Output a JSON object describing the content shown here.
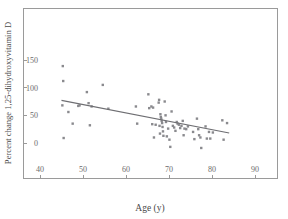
{
  "chart_data": {
    "type": "scatter",
    "title": "",
    "xlabel": "Age (y)",
    "ylabel": "Percent change 1,25-dihydroxyvitamin D",
    "xlim": [
      36,
      94
    ],
    "ylim": [
      -25,
      175
    ],
    "xticks": [
      40,
      50,
      60,
      70,
      80,
      90
    ],
    "yticks": [
      0,
      50,
      100,
      150
    ],
    "xtick_labels": [
      "40",
      "50",
      "60",
      "70",
      "80",
      "90"
    ],
    "ytick_labels": [
      "0",
      "50",
      "100",
      "150"
    ],
    "grid": false,
    "legend": null,
    "marker_color": "#8a8a8e",
    "line_color": "#6e6e72",
    "frame_color": "#9a9a9a",
    "points": [
      [
        45.3,
        139
      ],
      [
        45.4,
        112
      ],
      [
        45.2,
        68
      ],
      [
        45.5,
        9
      ],
      [
        46.6,
        56
      ],
      [
        47.6,
        35
      ],
      [
        48.9,
        67
      ],
      [
        49.2,
        68
      ],
      [
        50.9,
        92
      ],
      [
        51.3,
        72
      ],
      [
        51.6,
        32
      ],
      [
        52.0,
        66
      ],
      [
        54.6,
        105
      ],
      [
        55.9,
        62
      ],
      [
        62.3,
        66
      ],
      [
        62.6,
        35
      ],
      [
        65.2,
        88
      ],
      [
        65.4,
        63
      ],
      [
        65.9,
        66
      ],
      [
        66.1,
        34
      ],
      [
        66.3,
        64
      ],
      [
        66.5,
        10
      ],
      [
        66.9,
        33
      ],
      [
        67.6,
        73
      ],
      [
        67.7,
        78
      ],
      [
        67.8,
        31
      ],
      [
        67.9,
        17
      ],
      [
        68.0,
        52
      ],
      [
        68.1,
        47
      ],
      [
        68.2,
        44
      ],
      [
        68.3,
        40
      ],
      [
        68.4,
        36
      ],
      [
        68.5,
        29
      ],
      [
        68.6,
        21
      ],
      [
        68.7,
        13
      ],
      [
        69.0,
        75
      ],
      [
        69.2,
        50
      ],
      [
        69.3,
        38
      ],
      [
        69.5,
        12
      ],
      [
        69.8,
        26
      ],
      [
        70.1,
        6
      ],
      [
        70.3,
        -7
      ],
      [
        70.6,
        57
      ],
      [
        70.9,
        31
      ],
      [
        71.2,
        28
      ],
      [
        71.5,
        22
      ],
      [
        71.8,
        38
      ],
      [
        72.0,
        35
      ],
      [
        72.3,
        33
      ],
      [
        72.6,
        27
      ],
      [
        72.9,
        31
      ],
      [
        73.2,
        40
      ],
      [
        73.4,
        14
      ],
      [
        73.6,
        26
      ],
      [
        74.0,
        25
      ],
      [
        74.4,
        30
      ],
      [
        75.6,
        20
      ],
      [
        75.9,
        7
      ],
      [
        76.5,
        44
      ],
      [
        76.8,
        25
      ],
      [
        77.0,
        14
      ],
      [
        77.3,
        10
      ],
      [
        77.5,
        -9
      ],
      [
        78.5,
        30
      ],
      [
        78.8,
        8
      ],
      [
        79.3,
        20
      ],
      [
        79.6,
        8
      ],
      [
        80.2,
        19
      ],
      [
        82.4,
        41
      ],
      [
        82.7,
        6
      ],
      [
        83.5,
        36
      ]
    ],
    "trend_line": {
      "x_start": 45.0,
      "y_start": 77,
      "x_end": 84.0,
      "y_end": 18
    }
  }
}
